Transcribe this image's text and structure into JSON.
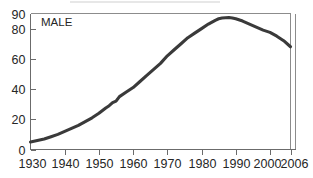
{
  "chart_data": {
    "type": "line",
    "title": "",
    "subtitle": "",
    "xlabel": "",
    "ylabel": "",
    "xlim": [
      1930,
      2006
    ],
    "ylim": [
      0,
      90
    ],
    "grid": false,
    "legend_position": "inside-top-left",
    "series_label": "MALE",
    "y_ticks": [
      0,
      20,
      40,
      60,
      80,
      90
    ],
    "y_tick_labels": [
      "0",
      "20",
      "40",
      "60",
      "80",
      "90"
    ],
    "x_ticks": [
      1930,
      1940,
      1950,
      1960,
      1970,
      1980,
      1990,
      2000,
      2006
    ],
    "x_tick_labels": [
      "1930",
      "1940",
      "1950",
      "1960",
      "1970",
      "1980",
      "1990",
      "2000",
      "2006"
    ],
    "line_color": "#3a3a3a",
    "axis_color": "#6b6b6b",
    "frame_color": "#8c8c8c",
    "series": [
      {
        "name": "MALE",
        "x": [
          1930,
          1932,
          1934,
          1936,
          1938,
          1940,
          1942,
          1944,
          1946,
          1948,
          1950,
          1952,
          1953,
          1954,
          1955,
          1956,
          1958,
          1960,
          1962,
          1964,
          1966,
          1968,
          1970,
          1972,
          1974,
          1976,
          1978,
          1980,
          1982,
          1984,
          1985,
          1986,
          1987,
          1988,
          1989,
          1990,
          1992,
          1994,
          1996,
          1998,
          2000,
          2002,
          2004,
          2006
        ],
        "values": [
          5,
          6,
          7,
          8.5,
          10,
          12,
          14,
          16,
          18.5,
          21,
          24,
          27.5,
          29,
          31,
          32,
          35,
          38,
          41,
          45,
          49,
          53,
          57,
          62,
          66,
          70,
          74,
          77,
          80,
          83,
          85.5,
          86.5,
          87,
          87.2,
          87.3,
          87,
          86.5,
          85,
          83,
          81,
          79,
          77.5,
          75,
          72,
          68
        ]
      }
    ]
  },
  "annotations": {
    "series_badge": "MALE"
  }
}
